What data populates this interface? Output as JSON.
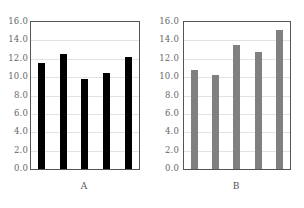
{
  "figure": {
    "background": "#ffffff",
    "panels": [
      {
        "id": "A",
        "caption": "A",
        "bar_color": "#000000"
      },
      {
        "id": "B",
        "caption": "B",
        "bar_color": "#808080"
      }
    ]
  },
  "axis": {
    "tick_labels": [
      "16.0",
      "14.0",
      "12.0",
      "10.0",
      "8.0",
      "6.0",
      "4.0",
      "2.0",
      "0.0"
    ],
    "grid_color": "#e2e2e2",
    "frame_color": "#555555",
    "label_color": "#666666"
  },
  "chart_data": [
    {
      "type": "bar",
      "title": "A",
      "categories": [
        "1",
        "2",
        "3",
        "4",
        "5"
      ],
      "values": [
        11.5,
        12.5,
        9.8,
        10.5,
        12.2
      ],
      "xlabel": "A",
      "ylabel": "",
      "ylim": [
        0.0,
        16.0
      ],
      "ytick_step": 2.0,
      "yticks": [
        0.0,
        2.0,
        4.0,
        6.0,
        8.0,
        10.0,
        12.0,
        14.0,
        16.0
      ],
      "ytick_labels": [
        "0.0",
        "2.0",
        "4.0",
        "6.0",
        "8.0",
        "10.0",
        "12.0",
        "14.0",
        "16.0"
      ],
      "bar_color": "#000000",
      "grid": true,
      "grid_axis": "y",
      "legend": false
    },
    {
      "type": "bar",
      "title": "B",
      "categories": [
        "1",
        "2",
        "3",
        "4",
        "5"
      ],
      "values": [
        10.8,
        10.2,
        13.5,
        12.7,
        15.1
      ],
      "xlabel": "B",
      "ylabel": "",
      "ylim": [
        0.0,
        16.0
      ],
      "ytick_step": 2.0,
      "yticks": [
        0.0,
        2.0,
        4.0,
        6.0,
        8.0,
        10.0,
        12.0,
        14.0,
        16.0
      ],
      "ytick_labels": [
        "0.0",
        "2.0",
        "4.0",
        "6.0",
        "8.0",
        "10.0",
        "12.0",
        "14.0",
        "16.0"
      ],
      "bar_color": "#808080",
      "grid": true,
      "grid_axis": "y",
      "legend": false
    }
  ]
}
